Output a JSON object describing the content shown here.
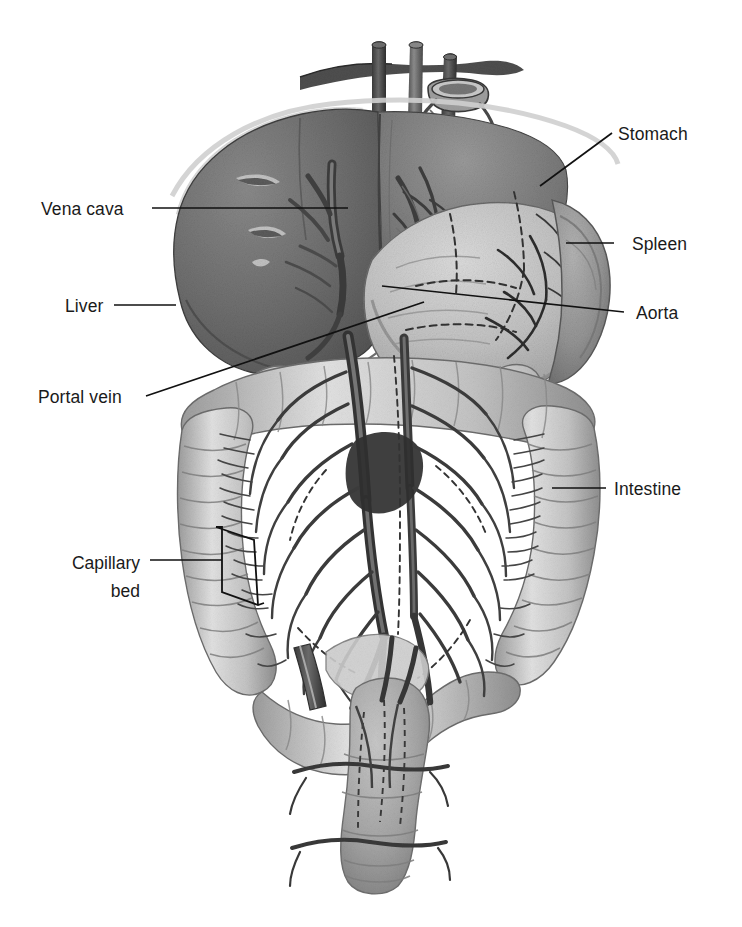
{
  "figure": {
    "type": "anatomical-illustration",
    "style": "grayscale pencil / airbrush medical illustration",
    "background_color": "#ffffff",
    "label_color": "#1a1a1a",
    "leader_line_color": "#111111"
  },
  "labels": {
    "vena_cava": "Vena cava",
    "liver": "Liver",
    "portal_vein": "Portal vein",
    "capillary_bed_line1": "Capillary",
    "capillary_bed_line2": "bed",
    "stomach": "Stomach",
    "spleen": "Spleen",
    "aorta": "Aorta",
    "intestine": "Intestine"
  },
  "structures": [
    {
      "name": "liver",
      "tone": "#6e6e6e",
      "side": "left",
      "label": "Liver"
    },
    {
      "name": "vena-cava",
      "tone": "#5a5a5a",
      "side": "center",
      "label": "Vena cava"
    },
    {
      "name": "portal-vein",
      "tone": "#4a4a4a",
      "side": "center",
      "label": "Portal vein"
    },
    {
      "name": "stomach",
      "tone": "#b4b4b4",
      "side": "right",
      "label": "Stomach"
    },
    {
      "name": "spleen",
      "tone": "#8f8f8f",
      "side": "right",
      "label": "Spleen"
    },
    {
      "name": "aorta",
      "tone": "#555555",
      "side": "center",
      "label": "Aorta"
    },
    {
      "name": "intestine",
      "tone": "#c0c0c0",
      "side": "right",
      "label": "Intestine"
    },
    {
      "name": "capillary-bed",
      "tone": "#9a9a9a",
      "side": "left",
      "label": "Capillary bed"
    },
    {
      "name": "rectum",
      "tone": "#a6a6a6",
      "side": "center",
      "label": ""
    }
  ]
}
